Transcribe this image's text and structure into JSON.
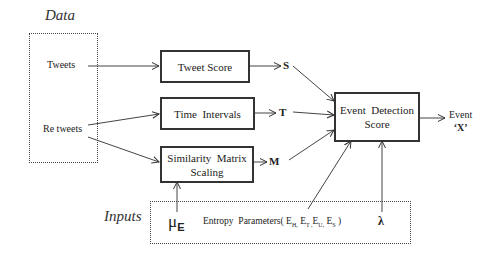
{
  "diagram": {
    "sections": {
      "data_label": "Data",
      "inputs_label": "Inputs"
    },
    "data_sources": [
      {
        "id": "tweets",
        "label": "Tweets"
      },
      {
        "id": "retweets",
        "label": "Re tweets"
      }
    ],
    "processes": [
      {
        "id": "tweet_score",
        "label": "Tweet Score",
        "output": "S"
      },
      {
        "id": "time_intervals",
        "label": "Time  Intervals",
        "output": "T"
      },
      {
        "id": "similarity",
        "label_line1": "Similarity  Matrix",
        "label_line2": "Scaling",
        "output": "M"
      }
    ],
    "event_detection": {
      "label_line1": "Event  Detection",
      "label_line2": "Score",
      "output_line1": "Event",
      "output_line2": "‘X’"
    },
    "inputs": {
      "mu": "μ",
      "mu_sub": "E",
      "entropy_prefix": "Entropy  Parameters(",
      "entropy_terms": [
        {
          "base": "E",
          "sub": "H,"
        },
        {
          "base": "E",
          "sub": "T ,"
        },
        {
          "base": "E",
          "sub": "U,"
        },
        {
          "base": "E",
          "sub": "S"
        }
      ],
      "entropy_suffix": ")",
      "lambda": "λ"
    },
    "edges": [
      {
        "from": "Tweets",
        "to": "Tweet Score"
      },
      {
        "from": "Re tweets",
        "to": "Time Intervals"
      },
      {
        "from": "Re tweets",
        "to": "Similarity Matrix Scaling"
      },
      {
        "from": "S",
        "to": "Event Detection Score"
      },
      {
        "from": "T",
        "to": "Event Detection Score"
      },
      {
        "from": "M",
        "to": "Event Detection Score"
      },
      {
        "from": "μE",
        "to": "Similarity Matrix Scaling"
      },
      {
        "from": "Entropy Parameters",
        "to": "Event Detection Score"
      },
      {
        "from": "λ",
        "to": "Event Detection Score"
      },
      {
        "from": "Event Detection Score",
        "to": "Event 'X'"
      }
    ]
  }
}
